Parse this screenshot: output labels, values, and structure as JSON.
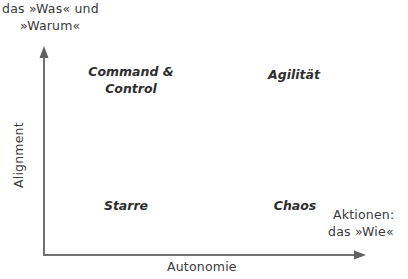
{
  "diagram": {
    "y_axis": {
      "label": "Alignment",
      "end_label_line1": "das »Was« und",
      "end_label_line2": "»Warum«"
    },
    "x_axis": {
      "label": "Autonomie",
      "end_label_line1": "Aktionen:",
      "end_label_line2": "das »Wie«"
    },
    "quadrants": {
      "top_left_line1": "Command &",
      "top_left_line2": "Control",
      "top_right": "Agilität",
      "bottom_left": "Starre",
      "bottom_right": "Chaos"
    },
    "colors": {
      "axis": "#6e6e6e",
      "text": "#3a3a3a"
    }
  }
}
